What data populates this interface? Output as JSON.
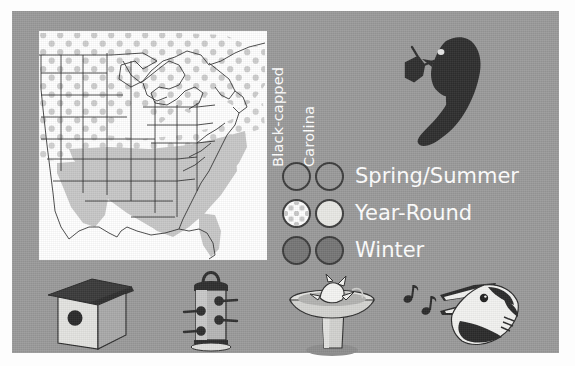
{
  "figure": {
    "background_color": "#9a9a9a",
    "panel_color": "#9a9a9a",
    "page_color": "#fdfdfd"
  },
  "map": {
    "name": "chickadee-range-map",
    "background_color": "#ffffff",
    "outline_color": "#2b2b2b",
    "regions": [
      {
        "key": "black-capped",
        "style": "polka-dot",
        "fill": "#ffffff",
        "dot_color": "#c9c9c9",
        "description": "Northern United States and southern Canada"
      },
      {
        "key": "carolina",
        "style": "solid-light-gray",
        "fill": "#c6c6c6",
        "description": "Southeastern United States"
      }
    ]
  },
  "legend": {
    "columns": [
      {
        "label": "Black-capped"
      },
      {
        "label": "Carolina"
      }
    ],
    "rows": [
      {
        "label": "Spring/Summer",
        "black_capped": {
          "style": "solid",
          "color": "#9a9a9a"
        },
        "carolina": {
          "style": "solid",
          "color": "#9a9a9a"
        }
      },
      {
        "label": "Year-Round",
        "black_capped": {
          "style": "polka-dot",
          "color": "#ffffff",
          "dot_color": "#c9c9c9"
        },
        "carolina": {
          "style": "solid",
          "color": "#e8e8e4"
        }
      },
      {
        "label": "Winter",
        "black_capped": {
          "style": "solid",
          "color": "#767676"
        },
        "carolina": {
          "style": "solid",
          "color": "#767676"
        }
      }
    ],
    "label_color": "#ffffff",
    "swatch_border_color": "#3c3c3c"
  },
  "illustrations": {
    "bird_silhouette": {
      "name": "chickadee-silhouette",
      "color": "#2e2e2e",
      "description": "Dark chickadee silhouette perched on a twig, facing left, with white eye highlight"
    },
    "bottom_icons": [
      {
        "name": "birdhouse-icon",
        "description": "Nest box with dark peaked roof and round entrance hole"
      },
      {
        "name": "bird-feeder-icon",
        "description": "Tube seed feeder with hanging loop, four ports and perches"
      },
      {
        "name": "birdbath-icon",
        "description": "Pedestal birdbath with a bird bathing in the basin"
      },
      {
        "name": "singing-bird-icon",
        "description": "Bird head with open beak and two music notes"
      }
    ]
  }
}
